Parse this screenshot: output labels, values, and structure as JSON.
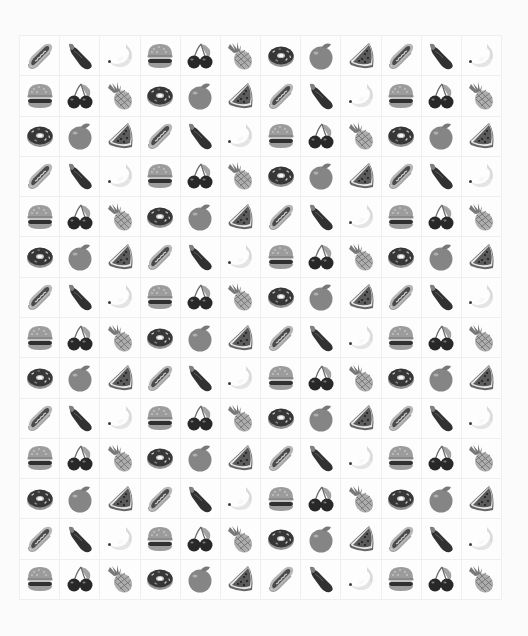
{
  "board": {
    "columns": 12,
    "rows": 14,
    "icon_cycle": [
      "hotdog",
      "eggplant",
      "banana",
      "burger",
      "cherries",
      "pineapple",
      "donut",
      "orange",
      "watermelon"
    ],
    "grid": [
      [
        "hotdog",
        "eggplant",
        "banana",
        "burger",
        "cherries",
        "pineapple",
        "donut",
        "orange",
        "watermelon",
        "hotdog",
        "eggplant",
        "banana"
      ],
      [
        "burger",
        "cherries",
        "pineapple",
        "donut",
        "orange",
        "watermelon",
        "hotdog",
        "eggplant",
        "banana",
        "burger",
        "cherries",
        "pineapple"
      ],
      [
        "donut",
        "orange",
        "watermelon",
        "hotdog",
        "eggplant",
        "banana",
        "burger",
        "cherries",
        "pineapple",
        "donut",
        "orange",
        "watermelon"
      ],
      [
        "hotdog",
        "eggplant",
        "banana",
        "burger",
        "cherries",
        "pineapple",
        "donut",
        "orange",
        "watermelon",
        "hotdog",
        "eggplant",
        "banana"
      ],
      [
        "burger",
        "cherries",
        "pineapple",
        "donut",
        "orange",
        "watermelon",
        "hotdog",
        "eggplant",
        "banana",
        "burger",
        "cherries",
        "pineapple"
      ],
      [
        "donut",
        "orange",
        "watermelon",
        "hotdog",
        "eggplant",
        "banana",
        "burger",
        "cherries",
        "pineapple",
        "donut",
        "orange",
        "watermelon"
      ],
      [
        "hotdog",
        "eggplant",
        "banana",
        "burger",
        "cherries",
        "pineapple",
        "donut",
        "orange",
        "watermelon",
        "hotdog",
        "eggplant",
        "banana"
      ],
      [
        "burger",
        "cherries",
        "pineapple",
        "donut",
        "orange",
        "watermelon",
        "hotdog",
        "eggplant",
        "banana",
        "burger",
        "cherries",
        "pineapple"
      ],
      [
        "donut",
        "orange",
        "watermelon",
        "hotdog",
        "eggplant",
        "banana",
        "burger",
        "cherries",
        "pineapple",
        "donut",
        "orange",
        "watermelon"
      ],
      [
        "hotdog",
        "eggplant",
        "banana",
        "burger",
        "cherries",
        "pineapple",
        "donut",
        "orange",
        "watermelon",
        "hotdog",
        "eggplant",
        "banana"
      ],
      [
        "burger",
        "cherries",
        "pineapple",
        "donut",
        "orange",
        "watermelon",
        "hotdog",
        "eggplant",
        "banana",
        "burger",
        "cherries",
        "pineapple"
      ],
      [
        "donut",
        "orange",
        "watermelon",
        "hotdog",
        "eggplant",
        "banana",
        "burger",
        "cherries",
        "pineapple",
        "donut",
        "orange",
        "watermelon"
      ],
      [
        "hotdog",
        "eggplant",
        "banana",
        "burger",
        "cherries",
        "pineapple",
        "donut",
        "orange",
        "watermelon",
        "hotdog",
        "eggplant",
        "banana"
      ],
      [
        "burger",
        "cherries",
        "pineapple",
        "donut",
        "orange",
        "watermelon",
        "hotdog",
        "eggplant",
        "banana",
        "burger",
        "cherries",
        "pineapple"
      ]
    ]
  },
  "colors": {
    "background": "#fbfbfb",
    "cell_border": "#efefef"
  }
}
